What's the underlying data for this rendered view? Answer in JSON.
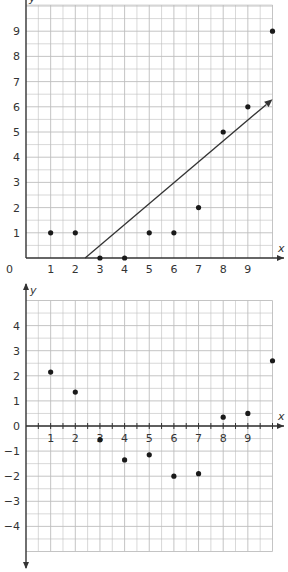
{
  "chart_data": [
    {
      "type": "scatter",
      "title": "",
      "xlabel": "x",
      "ylabel": "y",
      "xlim": [
        0,
        10
      ],
      "ylim": [
        0,
        10
      ],
      "grid": true,
      "grid_minor_step": 0.5,
      "x_ticks": [
        "0",
        "1",
        "2",
        "3",
        "4",
        "5",
        "6",
        "7",
        "8",
        "9"
      ],
      "y_ticks": [
        "1",
        "2",
        "3",
        "4",
        "5",
        "6",
        "7",
        "8",
        "9"
      ],
      "origin_label": "0",
      "points": [
        {
          "x": 1,
          "y": 1
        },
        {
          "x": 2,
          "y": 1
        },
        {
          "x": 3,
          "y": 0
        },
        {
          "x": 4,
          "y": 0
        },
        {
          "x": 5,
          "y": 1
        },
        {
          "x": 6,
          "y": 1
        },
        {
          "x": 7,
          "y": 2
        },
        {
          "x": 8,
          "y": 5
        },
        {
          "x": 9,
          "y": 6
        },
        {
          "x": 10,
          "y": 9
        }
      ],
      "fit_line": {
        "x1": 2.4,
        "y1": 0,
        "x2": 10,
        "y2": 6.3,
        "arrow": true
      }
    },
    {
      "type": "scatter",
      "title": "",
      "xlabel": "x",
      "ylabel": "y",
      "xlim": [
        0,
        10
      ],
      "ylim": [
        -5,
        5
      ],
      "grid": true,
      "grid_minor_step": 0.5,
      "x_ticks": [
        "1",
        "2",
        "3",
        "4",
        "5",
        "6",
        "7",
        "8",
        "9"
      ],
      "y_ticks": [
        "4",
        "3",
        "2",
        "1",
        "0",
        "-1",
        "-2",
        "-3",
        "-4"
      ],
      "points": [
        {
          "x": 1,
          "y": 2.15
        },
        {
          "x": 2,
          "y": 1.35
        },
        {
          "x": 3,
          "y": -0.55
        },
        {
          "x": 4,
          "y": -1.35
        },
        {
          "x": 5,
          "y": -1.15
        },
        {
          "x": 6,
          "y": -2.0
        },
        {
          "x": 7,
          "y": -1.9
        },
        {
          "x": 8,
          "y": 0.35
        },
        {
          "x": 9,
          "y": 0.5
        },
        {
          "x": 10,
          "y": 2.6
        }
      ]
    }
  ],
  "colors": {
    "grid": "#bdbdbd",
    "axis": "#333333",
    "point": "#1a1a1a",
    "line": "#333333"
  }
}
